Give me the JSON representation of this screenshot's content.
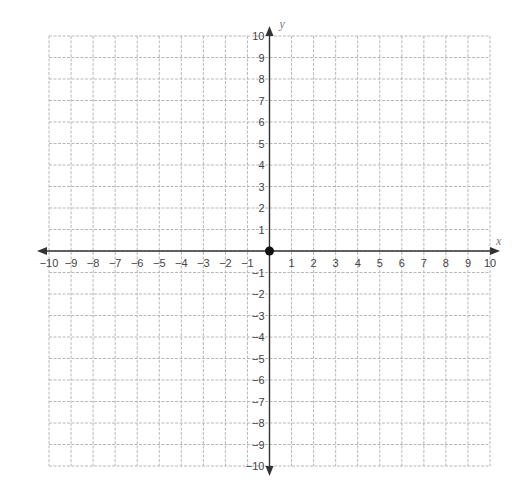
{
  "chart_data": {
    "type": "scatter",
    "title": "",
    "xlabel": "x",
    "ylabel": "y",
    "xlim": [
      -10,
      10
    ],
    "ylim": [
      -10,
      10
    ],
    "grid": true,
    "grid_style": "dashed",
    "x_ticks": [
      -10,
      -9,
      -8,
      -7,
      -6,
      -5,
      -4,
      -3,
      -2,
      -1,
      1,
      2,
      3,
      4,
      5,
      6,
      7,
      8,
      9,
      10
    ],
    "y_ticks": [
      10,
      9,
      8,
      7,
      6,
      5,
      4,
      3,
      2,
      1,
      -1,
      -2,
      -3,
      -4,
      -5,
      -6,
      -7,
      -8,
      -9,
      -10
    ],
    "points": [
      {
        "x": 0,
        "y": 0,
        "label": "origin"
      }
    ],
    "legend": null
  },
  "colors": {
    "grid": "#b8b8b8",
    "axis": "#333333",
    "point": "#111111",
    "tick_text": "#444444",
    "axis_label": "#777777"
  },
  "layout": {
    "x0": 49,
    "x1": 490,
    "y0": 36,
    "y1": 466
  }
}
